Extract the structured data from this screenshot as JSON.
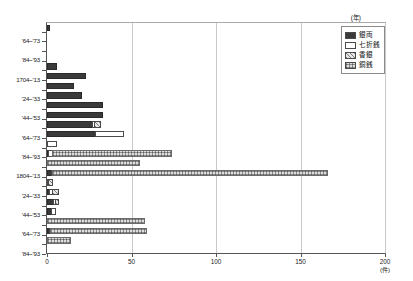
{
  "chart_data": {
    "type": "bar",
    "orientation": "horizontal",
    "stacked": true,
    "title": "",
    "xlabel": "(件)",
    "ylabel": "(年)",
    "xlim": [
      0,
      200
    ],
    "xticks": [
      0,
      50,
      100,
      150,
      200
    ],
    "xtick_labels": [
      "0",
      "50",
      "100",
      "150",
      "200"
    ],
    "grid": true,
    "legend_position": "top-right",
    "categories": [
      "'54~'63",
      "'64~'73",
      "'74~'83",
      "'84~'93",
      "'94~'03",
      "1704~'13",
      "'14~'23",
      "'24~'33",
      "'34~'43",
      "'44~'53",
      "'54~'63",
      "'64~'73",
      "'74~'83",
      "'84~'93",
      "'94~'03",
      "1804~'13",
      "'14~'23",
      "'24~'33",
      "'34~'43",
      "'44~'53",
      "'54~'63",
      "'64~'73",
      "'74~'83",
      "'84~'93"
    ],
    "visible_ytick_labels": [
      "'64~'73",
      "'84~'93",
      "1704~'13",
      "'24~'33",
      "'44~'53",
      "'64~'73",
      "'84~'93",
      "1804~'13",
      "'24~'33",
      "'44~'53",
      "'64~'73",
      "'84~'93"
    ],
    "series": [
      {
        "name": "銀両",
        "key": "ginryo",
        "color": "#3a3a3a",
        "pattern": "solid-dark",
        "values": [
          2,
          0,
          0,
          0,
          6,
          23,
          16,
          21,
          33,
          33,
          27,
          29,
          0,
          1,
          0,
          3,
          0,
          2,
          4,
          3,
          0,
          2,
          0,
          0
        ]
      },
      {
        "name": "七折銭",
        "key": "nanaore",
        "color": "#ffffff",
        "pattern": "open-white",
        "values": [
          0,
          0,
          0,
          0,
          0,
          0,
          0,
          0,
          0,
          0,
          2,
          17,
          6,
          3,
          0,
          1,
          1,
          2,
          2,
          3,
          0,
          1,
          0,
          0
        ]
      },
      {
        "name": "香銀",
        "key": "kagin",
        "color": "#b5b5b5",
        "pattern": "diagonal-hatch",
        "values": [
          0,
          0,
          0,
          0,
          0,
          0,
          0,
          0,
          0,
          0,
          4,
          0,
          0,
          0,
          0,
          0,
          3,
          4,
          2,
          0,
          0,
          0,
          0,
          0
        ]
      },
      {
        "name": "銅銭",
        "key": "dousen",
        "color": "#dcdcdc",
        "pattern": "cross-hatch",
        "values": [
          0,
          0,
          0,
          0,
          0,
          0,
          0,
          0,
          0,
          0,
          0,
          0,
          0,
          71,
          55,
          163,
          0,
          0,
          0,
          0,
          58,
          57,
          14,
          0
        ]
      }
    ],
    "row_totals": [
      2,
      0,
      0,
      0,
      6,
      23,
      16,
      21,
      33,
      33,
      33,
      46,
      6,
      75,
      55,
      167,
      4,
      8,
      8,
      6,
      58,
      60,
      14,
      0
    ]
  },
  "axes": {
    "x": {
      "unit_label": "(件)",
      "ticks": [
        "0",
        "50",
        "100",
        "150",
        "200"
      ]
    },
    "y": {
      "unit_label": "(年)"
    }
  },
  "legend": {
    "items": [
      {
        "label": "銀両",
        "swatch": "solid-dark"
      },
      {
        "label": "七折銭",
        "swatch": "open-white"
      },
      {
        "label": "香銀",
        "swatch": "diagonal-hatch"
      },
      {
        "label": "銅銭",
        "swatch": "cross-hatch"
      }
    ]
  }
}
